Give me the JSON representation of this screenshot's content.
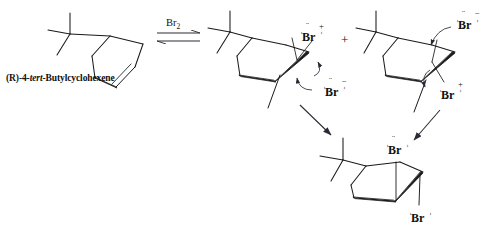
{
  "figure": {
    "title_visible": false,
    "background_color": "#ffffff",
    "line_color": "#1a1a1a"
  },
  "reactant": {
    "name_plain": "(R)-4-tert-Butylcyclohexene",
    "name_prefix": "(R)",
    "name_mid": "-4-",
    "name_italic": "tert",
    "name_suffix": "-Butylcyclohexene"
  },
  "reagent": {
    "label": "Br",
    "subscript": "2",
    "arrow_type": "equilibrium"
  },
  "separator": {
    "plus": "+"
  },
  "intermediate_left": {
    "bromonium_label": "Br",
    "bromonium_charge": "+",
    "bromide_label": "Br",
    "bromide_charge": "−"
  },
  "intermediate_right": {
    "bromide_label": "Br",
    "bromide_charge": "−",
    "bromonium_label": "Br",
    "bromonium_charge": "+"
  },
  "product": {
    "bromine_axial_label": "Br",
    "bromine_equatorial_label": "Br"
  },
  "lone_pair_dots": "¨"
}
